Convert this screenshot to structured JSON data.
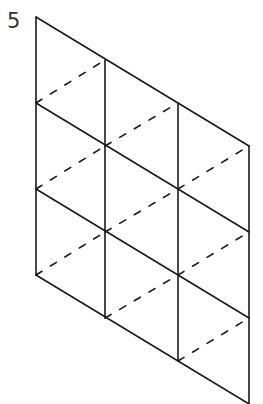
{
  "figure": {
    "label": "5",
    "line_color": "#1a1a1a",
    "background": "#ffffff"
  },
  "grid": {
    "columns_x": [
      36,
      105,
      178,
      249
    ],
    "column_tops_y": [
      17,
      60,
      103,
      146
    ],
    "row_spacing": 86,
    "rows": 3,
    "cols": 3,
    "solid_lines": "vertical columns and down-right diagonals",
    "dashed_lines": "up-right diagonals splitting each cell"
  }
}
